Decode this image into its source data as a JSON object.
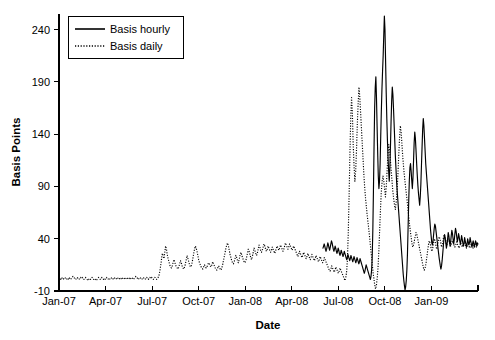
{
  "chart_data": {
    "type": "line",
    "title": "",
    "xlabel": "Date",
    "ylabel": "Basis Points",
    "xlim": [
      "Jan-07",
      "Apr-09"
    ],
    "ylim": [
      -10,
      255
    ],
    "yticks": [
      -10,
      40,
      90,
      140,
      190,
      240
    ],
    "ytick_labels": [
      "-10",
      "40",
      "90",
      "140",
      "190",
      "240"
    ],
    "xticks": [
      "Jan-07",
      "Apr-07",
      "Jul-07",
      "Oct-07",
      "Jan-08",
      "Apr-08",
      "Jul-08",
      "Oct-08",
      "Jan-09"
    ],
    "grid": false,
    "legend_position": "top-left",
    "legend": [
      {
        "name": "Basis hourly",
        "style": "solid"
      },
      {
        "name": "Basis daily",
        "style": "dotted"
      }
    ],
    "series": [
      {
        "name": "Basis daily",
        "style": "dotted",
        "x_start": "Jan-07",
        "x_end": "Apr-09",
        "values": [
          1,
          2,
          1,
          3,
          2,
          1,
          2,
          3,
          2,
          1,
          2,
          1,
          3,
          2,
          1,
          2,
          3,
          4,
          3,
          2,
          1,
          2,
          3,
          2,
          1,
          2,
          3,
          2,
          3,
          2,
          1,
          2,
          3,
          2,
          1,
          0,
          1,
          2,
          1,
          2,
          3,
          2,
          1,
          2,
          1,
          0,
          1,
          2,
          3,
          2,
          1,
          2,
          3,
          2,
          1,
          2,
          1,
          2,
          3,
          2,
          1,
          2,
          1,
          2,
          3,
          2,
          1,
          2,
          3,
          2,
          1,
          2,
          3,
          2,
          1,
          2,
          1,
          2,
          3,
          2,
          1,
          2,
          3,
          2,
          3,
          2,
          1,
          2,
          3,
          2,
          1,
          2,
          3,
          4,
          3,
          2,
          1,
          2,
          3,
          2,
          1,
          2,
          3,
          2,
          1,
          2,
          3,
          2,
          1,
          2,
          3,
          2,
          3,
          2,
          1,
          2,
          3,
          2,
          1,
          2,
          3,
          5,
          9,
          14,
          20,
          26,
          24,
          21,
          27,
          33,
          30,
          25,
          21,
          18,
          15,
          13,
          12,
          14,
          17,
          20,
          18,
          15,
          13,
          12,
          11,
          13,
          16,
          19,
          17,
          14,
          12,
          11,
          13,
          16,
          20,
          24,
          21,
          18,
          15,
          13,
          14,
          17,
          21,
          26,
          30,
          33,
          31,
          28,
          24,
          20,
          17,
          15,
          13,
          12,
          11,
          13,
          15,
          14,
          12,
          13,
          15,
          17,
          16,
          14,
          13,
          15,
          18,
          16,
          14,
          12,
          11,
          10,
          12,
          14,
          13,
          11,
          10,
          12,
          15,
          19,
          23,
          27,
          31,
          34,
          36,
          33,
          29,
          25,
          22,
          19,
          17,
          16,
          18,
          21,
          24,
          22,
          19,
          17,
          20,
          24,
          27,
          25,
          22,
          20,
          18,
          17,
          19,
          22,
          26,
          30,
          28,
          25,
          22,
          20,
          23,
          27,
          31,
          29,
          26,
          24,
          26,
          30,
          34,
          32,
          29,
          27,
          29,
          32,
          35,
          33,
          30,
          28,
          30,
          33,
          31,
          29,
          27,
          29,
          32,
          30,
          28,
          26,
          28,
          31,
          33,
          31,
          29,
          31,
          34,
          32,
          30,
          28,
          30,
          33,
          36,
          34,
          32,
          30,
          32,
          35,
          33,
          31,
          29,
          31,
          33,
          31,
          29,
          27,
          25,
          23,
          25,
          28,
          26,
          24,
          22,
          24,
          27,
          25,
          23,
          21,
          23,
          26,
          24,
          22,
          20,
          22,
          25,
          23,
          21,
          19,
          21,
          24,
          22,
          20,
          18,
          20,
          23,
          21,
          19,
          17,
          19,
          22,
          20,
          18,
          16,
          14,
          12,
          10,
          9,
          11,
          14,
          12,
          10,
          8,
          10,
          13,
          11,
          9,
          7,
          9,
          12,
          10,
          8,
          6,
          4,
          2,
          0,
          3,
          8,
          20,
          45,
          80,
          120,
          155,
          175,
          160,
          130,
          110,
          95,
          105,
          125,
          150,
          170,
          185,
          175,
          160,
          145,
          130,
          115,
          100,
          88,
          78,
          70,
          62,
          55,
          48,
          40,
          32,
          24,
          16,
          8,
          2,
          -4,
          -8,
          -5,
          2,
          12,
          28,
          48,
          68,
          85,
          95,
          100,
          95,
          88,
          80,
          90,
          105,
          120,
          130,
          125,
          115,
          105,
          95,
          85,
          78,
          72,
          68,
          75,
          85,
          100,
          118,
          135,
          148,
          142,
          130,
          118,
          108,
          100,
          92,
          85,
          78,
          70,
          62,
          55,
          48,
          42,
          36,
          32,
          34,
          38,
          42,
          46,
          44,
          40,
          36,
          32,
          28,
          24,
          20,
          16,
          12,
          10,
          12,
          16,
          22,
          28,
          34,
          38,
          36,
          32,
          28,
          30,
          35,
          40,
          38,
          34,
          30,
          33,
          38,
          42,
          40,
          36,
          32,
          35,
          40,
          44,
          42,
          38,
          34,
          36,
          40,
          38,
          35,
          33,
          35,
          38,
          36,
          34,
          32,
          34,
          37,
          35,
          33,
          31,
          33,
          36,
          34,
          32,
          34,
          37,
          35,
          33,
          31,
          33,
          35,
          33,
          31,
          33,
          35,
          33,
          31,
          33,
          35,
          34,
          32,
          34,
          33
        ]
      },
      {
        "name": "Basis hourly",
        "style": "solid",
        "x_start": "Jun-08",
        "x_end": "Apr-09",
        "values": [
          31,
          33,
          35,
          33,
          30,
          28,
          30,
          33,
          36,
          34,
          31,
          29,
          32,
          35,
          38,
          36,
          33,
          30,
          28,
          30,
          33,
          31,
          28,
          26,
          28,
          31,
          29,
          26,
          24,
          26,
          29,
          27,
          25,
          23,
          25,
          28,
          26,
          24,
          22,
          20,
          22,
          25,
          23,
          21,
          19,
          21,
          24,
          22,
          20,
          18,
          20,
          23,
          21,
          19,
          17,
          19,
          22,
          20,
          18,
          16,
          18,
          21,
          19,
          17,
          15,
          13,
          11,
          9,
          7,
          9,
          12,
          15,
          13,
          11,
          9,
          7,
          5,
          3,
          1,
          4,
          10,
          22,
          48,
          85,
          128,
          165,
          185,
          195,
          175,
          148,
          122,
          100,
          88,
          95,
          112,
          138,
          162,
          183,
          200,
          215,
          235,
          253,
          240,
          210,
          180,
          155,
          135,
          118,
          105,
          95,
          108,
          128,
          152,
          172,
          185,
          178,
          165,
          150,
          135,
          120,
          108,
          96,
          86,
          78,
          70,
          62,
          54,
          46,
          38,
          30,
          22,
          14,
          6,
          0,
          -5,
          -9,
          -6,
          0,
          10,
          26,
          50,
          75,
          95,
          108,
          112,
          105,
          96,
          88,
          98,
          115,
          132,
          142,
          136,
          125,
          113,
          102,
          92,
          84,
          78,
          72,
          80,
          92,
          110,
          128,
          145,
          155,
          148,
          136,
          124,
          112,
          104,
          96,
          88,
          80,
          72,
          64,
          56,
          48,
          42,
          36,
          34,
          38,
          44,
          50,
          54,
          52,
          47,
          42,
          37,
          32,
          27,
          22,
          18,
          14,
          11,
          14,
          19,
          26,
          33,
          40,
          44,
          41,
          36,
          31,
          34,
          40,
          46,
          43,
          38,
          33,
          37,
          43,
          48,
          45,
          40,
          35,
          39,
          45,
          50,
          47,
          42,
          37,
          40,
          45,
          42,
          38,
          35,
          38,
          43,
          40,
          36,
          33,
          36,
          41,
          38,
          35,
          32,
          35,
          40,
          37,
          34,
          36,
          41,
          38,
          35,
          32,
          35,
          38,
          35,
          32,
          35,
          38,
          36,
          33,
          36,
          35
        ]
      }
    ]
  }
}
